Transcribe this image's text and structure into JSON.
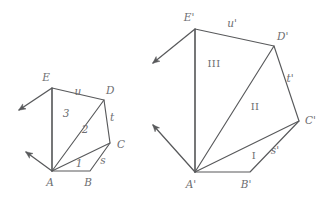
{
  "figure": {
    "stroke_color": "#58595b",
    "label_color": "#6d6e71",
    "background": "#ffffff",
    "left_polygon": {
      "name": "ABCDE",
      "vertices": [
        {
          "id": "A",
          "label": "A",
          "x": 52,
          "y": 171,
          "label_x": 50,
          "label_y": 186
        },
        {
          "id": "B",
          "label": "B",
          "x": 90,
          "y": 171,
          "label_x": 88,
          "label_y": 186
        },
        {
          "id": "C",
          "label": "C",
          "x": 110,
          "y": 143,
          "label_x": 117,
          "label_y": 148
        },
        {
          "id": "D",
          "label": "D",
          "x": 104,
          "y": 100,
          "label_x": 106,
          "label_y": 94
        },
        {
          "id": "E",
          "label": "E",
          "x": 52,
          "y": 88,
          "label_x": 46,
          "label_y": 81
        }
      ],
      "edge_labels": [
        {
          "id": "u",
          "label": "u",
          "x": 78,
          "y": 95
        },
        {
          "id": "t",
          "label": "t",
          "x": 112,
          "y": 121
        },
        {
          "id": "s",
          "label": "s",
          "x": 103,
          "y": 164
        }
      ],
      "region_labels": [
        {
          "id": "1",
          "label": "1",
          "x": 79,
          "y": 167
        },
        {
          "id": "2",
          "label": "2",
          "x": 85,
          "y": 133
        },
        {
          "id": "3",
          "label": "3",
          "x": 66,
          "y": 117
        }
      ],
      "diagonals": [
        "A-C",
        "A-D"
      ],
      "rays": [
        {
          "from": "E",
          "to_x": 18,
          "to_y": 111
        },
        {
          "from": "A",
          "to_x": 25,
          "to_y": 151
        }
      ]
    },
    "right_polygon": {
      "name": "A'B'C'D'E'",
      "vertices": [
        {
          "id": "Ap",
          "label": "A'",
          "x": 195,
          "y": 172,
          "label_x": 191,
          "label_y": 188
        },
        {
          "id": "Bp",
          "label": "B'",
          "x": 250,
          "y": 172,
          "label_x": 246,
          "label_y": 188
        },
        {
          "id": "Cp",
          "label": "C'",
          "x": 299,
          "y": 121,
          "label_x": 305,
          "label_y": 124
        },
        {
          "id": "Dp",
          "label": "D'",
          "x": 274,
          "y": 46,
          "label_x": 277,
          "label_y": 40
        },
        {
          "id": "Ep",
          "label": "E'",
          "x": 195,
          "y": 29,
          "label_x": 189,
          "label_y": 21
        }
      ],
      "edge_labels": [
        {
          "id": "up",
          "label": "u'",
          "x": 232,
          "y": 27
        },
        {
          "id": "tp",
          "label": "t'",
          "x": 290,
          "y": 82
        },
        {
          "id": "sp",
          "label": "s'",
          "x": 275,
          "y": 154
        }
      ],
      "region_labels": [
        {
          "id": "I",
          "label": "I",
          "x": 254,
          "y": 159
        },
        {
          "id": "II",
          "label": "II",
          "x": 255,
          "y": 110
        },
        {
          "id": "III",
          "label": "III",
          "x": 214,
          "y": 67
        }
      ],
      "diagonals": [
        "A'-C'",
        "A'-D'"
      ],
      "rays": [
        {
          "from": "E'",
          "to_x": 152,
          "to_y": 64
        },
        {
          "from": "A'",
          "to_x": 152,
          "to_y": 124
        }
      ]
    }
  }
}
